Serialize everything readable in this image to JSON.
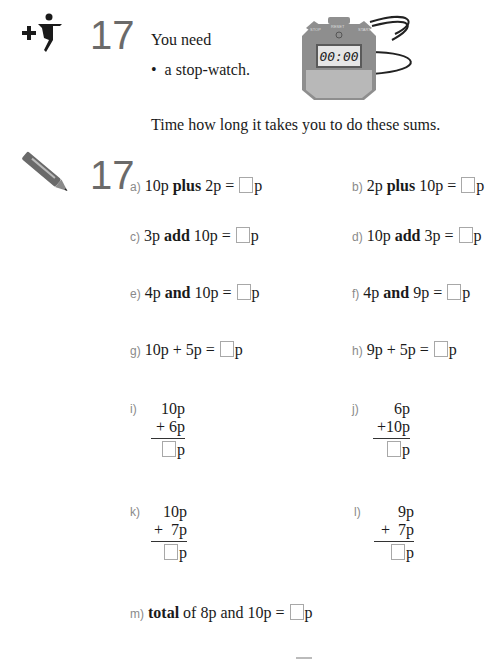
{
  "section_number": "17",
  "header": {
    "intro": "You need",
    "bullet": "a stop-watch.",
    "instruction": "Time how long it takes you to do these sums."
  },
  "stopwatch": {
    "display": "00:00",
    "buttons": [
      "STOP",
      "RESET",
      "START"
    ],
    "colors": {
      "body": "#8a8a8a",
      "face": "#b9b9b9",
      "screen": "#e6e6e6",
      "strap": "#222222"
    }
  },
  "icons": {
    "activity": "figure-plus-icon",
    "written": "pencil-icon"
  },
  "questions": [
    {
      "id": "a",
      "label": "a)",
      "pre": "10p ",
      "op": "plus",
      "post": " 2p = ",
      "unit": "p"
    },
    {
      "id": "b",
      "label": "b)",
      "pre": "2p ",
      "op": "plus",
      "post": " 10p = ",
      "unit": "p"
    },
    {
      "id": "c",
      "label": "c)",
      "pre": "3p ",
      "op": "add",
      "post": " 10p = ",
      "unit": "p"
    },
    {
      "id": "d",
      "label": "d)",
      "pre": "10p ",
      "op": "add",
      "post": " 3p = ",
      "unit": "p"
    },
    {
      "id": "e",
      "label": "e)",
      "pre": "4p ",
      "op": "and",
      "post": " 10p = ",
      "unit": "p"
    },
    {
      "id": "f",
      "label": "f)",
      "pre": "4p ",
      "op": "and",
      "post": " 9p = ",
      "unit": "p"
    },
    {
      "id": "g",
      "label": "g)",
      "pre": "10p + 5p = ",
      "op": "",
      "post": "",
      "unit": "p"
    },
    {
      "id": "h",
      "label": "h)",
      "pre": "9p + 5p = ",
      "op": "",
      "post": "",
      "unit": "p"
    }
  ],
  "vertical_sums": [
    {
      "id": "i",
      "label": "i)",
      "top": "10p",
      "bottom": "+ 6p",
      "unit": "p"
    },
    {
      "id": "j",
      "label": "j)",
      "top": "6p",
      "bottom": "+10p",
      "unit": "p"
    },
    {
      "id": "k",
      "label": "k)",
      "top": "10p",
      "bottom": "+  7p",
      "unit": "p"
    },
    {
      "id": "l",
      "label": "l)",
      "top": "9p",
      "bottom": "+  7p",
      "unit": "p"
    }
  ],
  "final_question": {
    "id": "m",
    "label": "m)",
    "op": "total",
    "rest": " of 8p and 10p = ",
    "unit": "p"
  }
}
